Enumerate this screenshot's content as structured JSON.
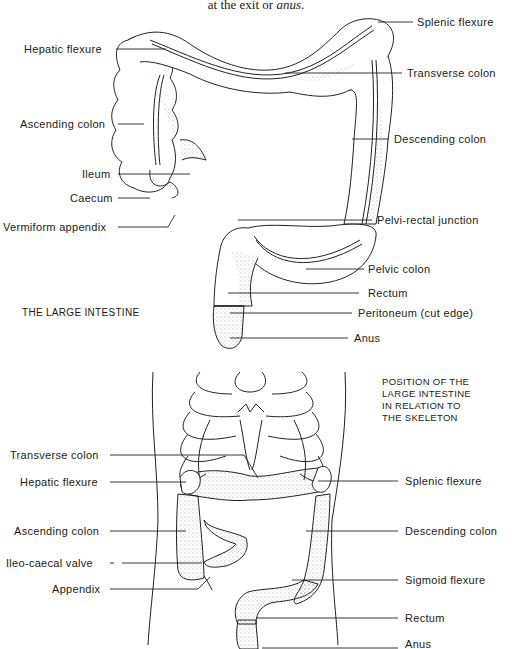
{
  "caption_top": {
    "prefix": "at the exit or ",
    "emph": "anus",
    "suffix": "."
  },
  "top_diagram": {
    "title": "THE LARGE INTESTINE",
    "labels": {
      "splenic_flexure": "Splenic flexure",
      "hepatic_flexure": "Hepatic flexure",
      "transverse_colon": "Transverse colon",
      "ascending_colon": "Ascending colon",
      "descending_colon": "Descending colon",
      "ileum": "Ileum",
      "caecum": "Caecum",
      "vermiform_appendix": "Vermiform appendix",
      "pelvi_rectal_junction": "Pelvi-rectal junction",
      "pelvic_colon": "Pelvic colon",
      "rectum": "Rectum",
      "peritoneum": "Peritoneum (cut edge)",
      "anus": "Anus"
    }
  },
  "bottom_diagram": {
    "title_lines": [
      "POSITION OF THE",
      "LARGE INTESTINE",
      "IN RELATION TO",
      "THE SKELETON"
    ],
    "labels": {
      "transverse_colon": "Transverse colon",
      "hepatic_flexure": "Hepatic flexure",
      "splenic_flexure": "Splenic flexure",
      "ascending_colon": "Ascending colon",
      "descending_colon": "Descending colon",
      "ileo_caecal_valve": "Ileo-caecal valve",
      "appendix": "Appendix",
      "sigmoid_flexure": "Sigmoid flexure",
      "rectum": "Rectum",
      "anus": "Anus"
    }
  }
}
